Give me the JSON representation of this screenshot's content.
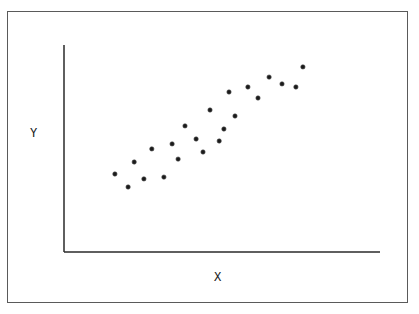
{
  "chart_data": {
    "type": "scatter",
    "title": "",
    "xlabel": "X",
    "ylabel": "Y",
    "grid": false,
    "legend": null,
    "ticks": "none",
    "xlim": [
      0,
      100
    ],
    "ylim": [
      0,
      100
    ],
    "note": "No tick marks or numeric labels are shown; values are normalized 0-100 along each drawn axis.",
    "points": [
      {
        "x": 16.1,
        "y": 37.7
      },
      {
        "x": 20.3,
        "y": 31.4
      },
      {
        "x": 22.2,
        "y": 43.5
      },
      {
        "x": 25.3,
        "y": 35.3
      },
      {
        "x": 27.8,
        "y": 49.8
      },
      {
        "x": 31.6,
        "y": 36.2
      },
      {
        "x": 34.2,
        "y": 52.2
      },
      {
        "x": 36.1,
        "y": 44.9
      },
      {
        "x": 38.3,
        "y": 60.9
      },
      {
        "x": 41.8,
        "y": 54.6
      },
      {
        "x": 44.0,
        "y": 48.3
      },
      {
        "x": 46.2,
        "y": 68.6
      },
      {
        "x": 49.1,
        "y": 53.6
      },
      {
        "x": 50.6,
        "y": 59.4
      },
      {
        "x": 52.2,
        "y": 77.3
      },
      {
        "x": 54.1,
        "y": 65.7
      },
      {
        "x": 58.2,
        "y": 79.7
      },
      {
        "x": 61.4,
        "y": 74.4
      },
      {
        "x": 64.9,
        "y": 84.5
      },
      {
        "x": 69.0,
        "y": 81.2
      },
      {
        "x": 73.4,
        "y": 79.7
      },
      {
        "x": 75.6,
        "y": 89.4
      }
    ]
  },
  "colors": {
    "axis": "#2a2a2a",
    "point": "#1a1a1a",
    "frame": "#5a5a5a",
    "background": "#ffffff"
  }
}
